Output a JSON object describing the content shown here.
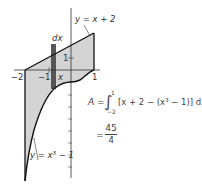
{
  "diagram": {
    "type": "area-between-curves",
    "curves": [
      {
        "label": "y = x + 2",
        "expr": "x+2"
      },
      {
        "label": "y = x³ − 1",
        "expr": "x^3-1"
      }
    ],
    "interval": [
      -2,
      1
    ],
    "strip_label": "dx",
    "strip_x_label": "x",
    "x_ticks": [
      "−2",
      "−1",
      "1"
    ],
    "y_ticks": [
      "1"
    ],
    "fill_color": "#d4d4d4",
    "strip_color": "#555555"
  },
  "formula": {
    "lhs": "A =",
    "integral_upper": "1",
    "integral_lower": "−2",
    "integrand": "[x + 2 − (x³ − 1)] dx",
    "result_eq": "=",
    "numerator": "45",
    "denominator": "4"
  }
}
